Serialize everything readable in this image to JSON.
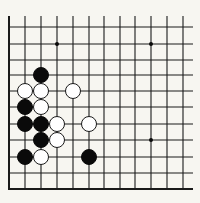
{
  "board": {
    "title": "Go board diagram (partial, lower-left corner)",
    "colors": {
      "background": "#f7f6f1",
      "line": "#1a1a1a",
      "black_stone": "#0a0a0a",
      "white_stone": "#ffffff",
      "white_stone_outline": "#1a1a1a",
      "star_point": "#0a0a0a"
    },
    "columns_x": [
      9,
      25,
      41,
      57,
      73,
      89,
      104,
      120,
      135,
      151,
      167,
      183
    ],
    "rows_y": [
      27,
      44,
      60,
      75,
      91,
      107,
      124,
      140,
      157,
      173
    ],
    "top_stub_y": 16,
    "right_stub_x": 193,
    "left_edge_x": 9,
    "bottom_edge_y": 189,
    "stone_radius": 7.5,
    "star_points": [
      {
        "col": 3,
        "row": 1
      },
      {
        "col": 9,
        "row": 1
      },
      {
        "col": 9,
        "row": 7
      }
    ],
    "stones": [
      {
        "color": "black",
        "col": 2,
        "row": 3
      },
      {
        "color": "white",
        "col": 1,
        "row": 4
      },
      {
        "color": "white",
        "col": 2,
        "row": 4
      },
      {
        "color": "white",
        "col": 4,
        "row": 4
      },
      {
        "color": "black",
        "col": 1,
        "row": 5
      },
      {
        "color": "white",
        "col": 2,
        "row": 5
      },
      {
        "color": "black",
        "col": 1,
        "row": 6
      },
      {
        "color": "black",
        "col": 2,
        "row": 6
      },
      {
        "color": "white",
        "col": 3,
        "row": 6
      },
      {
        "color": "white",
        "col": 5,
        "row": 6
      },
      {
        "color": "black",
        "col": 2,
        "row": 7
      },
      {
        "color": "white",
        "col": 3,
        "row": 7
      },
      {
        "color": "black",
        "col": 1,
        "row": 8
      },
      {
        "color": "white",
        "col": 2,
        "row": 8
      },
      {
        "color": "black",
        "col": 5,
        "row": 8
      }
    ]
  }
}
